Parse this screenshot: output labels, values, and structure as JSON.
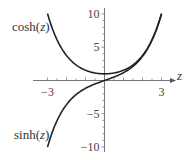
{
  "chart_data": {
    "type": "line",
    "title": "",
    "xlabel": "z",
    "ylabel": "",
    "xlim": [
      -3.5,
      3.5
    ],
    "ylim": [
      -10.5,
      10.5
    ],
    "grid": false,
    "x_ticks": [
      -3,
      3
    ],
    "x_tick_labels": [
      "−3",
      "3"
    ],
    "y_ticks": [
      10,
      5,
      -5,
      -10
    ],
    "y_tick_labels": [
      "10",
      "5",
      "−5",
      "−10"
    ],
    "series": [
      {
        "name": "cosh(z)",
        "function": "cosh",
        "x": [
          -3,
          -2.5,
          -2,
          -1.5,
          -1,
          -0.5,
          0,
          0.5,
          1,
          1.5,
          2,
          2.5,
          3
        ],
        "values": [
          10.07,
          6.13,
          3.76,
          2.35,
          1.54,
          1.13,
          1.0,
          1.13,
          1.54,
          2.35,
          3.76,
          6.13,
          10.07
        ]
      },
      {
        "name": "sinh(z)",
        "function": "sinh",
        "x": [
          -3,
          -2.5,
          -2,
          -1.5,
          -1,
          -0.5,
          0,
          0.5,
          1,
          1.5,
          2,
          2.5,
          3
        ],
        "values": [
          -10.02,
          -6.05,
          -3.63,
          -2.13,
          -1.18,
          -0.52,
          0.0,
          0.52,
          1.18,
          2.13,
          3.63,
          6.05,
          10.02
        ]
      }
    ],
    "annotations": [
      {
        "text": "cosh(z)",
        "near": "upper-left"
      },
      {
        "text": "sinh(z)",
        "near": "lower-left"
      }
    ]
  },
  "labels": {
    "cosh": "cosh(",
    "sinh": "sinh(",
    "z": "z",
    "close": ")",
    "axis_z": "z"
  }
}
